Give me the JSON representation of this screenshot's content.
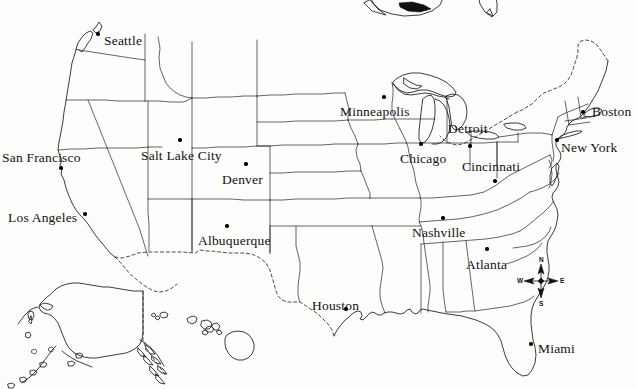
{
  "map": {
    "title": "United States major cities reference map",
    "background_color": "#fdfdfc",
    "line_color": "#1a1a1a",
    "projection_note": "Contiguous United States with Alaska and Hawaii insets",
    "cities": [
      {
        "name": "Seattle",
        "label_x": 104,
        "label_y": 34,
        "dot_x": 98,
        "dot_y": 34,
        "dot_anchor": "left",
        "leader": null
      },
      {
        "name": "San Francisco",
        "label_x": 2,
        "label_y": 151,
        "dot_x": 61,
        "dot_y": 168,
        "dot_anchor": "below",
        "leader": null
      },
      {
        "name": "Los Angeles",
        "label_x": 8,
        "label_y": 211,
        "dot_x": 85,
        "dot_y": 214,
        "dot_anchor": "right",
        "leader": null
      },
      {
        "name": "Salt Lake City",
        "label_x": 141,
        "label_y": 149,
        "dot_x": 180,
        "dot_y": 140,
        "dot_anchor": "above",
        "leader": null
      },
      {
        "name": "Denver",
        "label_x": 222,
        "label_y": 173,
        "dot_x": 246,
        "dot_y": 164,
        "dot_anchor": "above",
        "leader": null
      },
      {
        "name": "Albuquerque",
        "label_x": 198,
        "label_y": 234,
        "dot_x": 227,
        "dot_y": 226,
        "dot_anchor": "above",
        "leader": null
      },
      {
        "name": "Minneapolis",
        "label_x": 340,
        "label_y": 105,
        "dot_x": 384,
        "dot_y": 97,
        "dot_anchor": "above",
        "leader": null
      },
      {
        "name": "Chicago",
        "label_x": 400,
        "label_y": 152,
        "dot_x": 421,
        "dot_y": 144,
        "dot_anchor": "above",
        "leader": null
      },
      {
        "name": "Detroit",
        "label_x": 448,
        "label_y": 122,
        "dot_x": 470,
        "dot_y": 146,
        "dot_anchor": "leader",
        "leader": {
          "x1": 471,
          "y1": 130,
          "x2": 471,
          "y2": 145
        }
      },
      {
        "name": "Cincinnati",
        "label_x": 462,
        "label_y": 160,
        "dot_x": 495,
        "dot_y": 181,
        "dot_anchor": "leader",
        "leader": {
          "x1": 497,
          "y1": 142,
          "x2": 497,
          "y2": 166
        }
      },
      {
        "name": "Boston",
        "label_x": 592,
        "label_y": 105,
        "dot_x": 583,
        "dot_y": 112,
        "dot_anchor": "left",
        "leader": null
      },
      {
        "name": "New York",
        "label_x": 561,
        "label_y": 141,
        "dot_x": 557,
        "dot_y": 140,
        "dot_anchor": "left",
        "leader": null
      },
      {
        "name": "Nashville",
        "label_x": 412,
        "label_y": 226,
        "dot_x": 443,
        "dot_y": 218,
        "dot_anchor": "above",
        "leader": null
      },
      {
        "name": "Atlanta",
        "label_x": 466,
        "label_y": 258,
        "dot_x": 487,
        "dot_y": 249,
        "dot_anchor": "above",
        "leader": null
      },
      {
        "name": "Houston",
        "label_x": 312,
        "label_y": 299,
        "dot_x": 346,
        "dot_y": 309,
        "dot_anchor": "below",
        "leader": null
      },
      {
        "name": "Miami",
        "label_x": 538,
        "label_y": 342,
        "dot_x": 531,
        "dot_y": 344,
        "dot_anchor": "left",
        "leader": null
      }
    ],
    "compass": {
      "center_x": 541,
      "center_y": 281,
      "north": "N",
      "east": "E",
      "south": "S",
      "west": "W"
    },
    "insets": [
      {
        "name": "Alaska"
      },
      {
        "name": "Hawaii"
      }
    ]
  }
}
